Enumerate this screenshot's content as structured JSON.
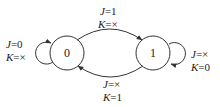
{
  "diagram": {
    "type": "state-transition",
    "colors": {
      "stroke": "#333333",
      "text": "#222222",
      "background": "#ffffff"
    },
    "states": [
      {
        "id": "s0",
        "label": "0"
      },
      {
        "id": "s1",
        "label": "1"
      }
    ],
    "transitions": [
      {
        "from": "0",
        "to": "0",
        "j_var": "J",
        "j_val": "=0",
        "k_var": "K",
        "k_val": "=×"
      },
      {
        "from": "0",
        "to": "1",
        "j_var": "J",
        "j_val": "=1",
        "k_var": "K",
        "k_val": "=×"
      },
      {
        "from": "1",
        "to": "1",
        "j_var": "J",
        "j_val": "=×",
        "k_var": "K",
        "k_val": "=0"
      },
      {
        "from": "1",
        "to": "0",
        "j_var": "J",
        "j_val": "=×",
        "k_var": "K",
        "k_val": "=1"
      }
    ]
  }
}
